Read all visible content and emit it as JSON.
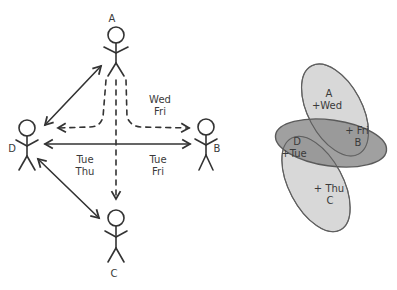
{
  "left_diagram": {
    "people": [
      {
        "id": "A",
        "label": "A"
      },
      {
        "id": "B",
        "label": "B"
      },
      {
        "id": "C",
        "label": "C"
      },
      {
        "id": "D",
        "label": "D"
      }
    ],
    "edge_labels": {
      "a_to_bd_dashed": {
        "line1": "Wed",
        "line2": "Fri"
      },
      "d_left_of_center": {
        "line1": "Tue",
        "line2": "Thu"
      },
      "b_right_of_center": {
        "line1": "Tue",
        "line2": "Fri"
      }
    },
    "connections": [
      {
        "from": "A",
        "to": "D",
        "style": "solid",
        "direction": "both"
      },
      {
        "from": "D",
        "to": "B",
        "style": "solid",
        "direction": "both"
      },
      {
        "from": "D",
        "to": "C",
        "style": "solid",
        "direction": "both"
      },
      {
        "from": "A",
        "to": "D",
        "style": "dashed",
        "direction": "to"
      },
      {
        "from": "A",
        "to": "B",
        "style": "dashed",
        "direction": "to"
      },
      {
        "from": "A",
        "to": "C",
        "style": "dashed",
        "direction": "to"
      }
    ]
  },
  "right_diagram": {
    "ellipses": [
      {
        "name": "A-set",
        "line1": "A",
        "line2": "+Wed"
      },
      {
        "name": "DB-set",
        "line1": "+ Fri",
        "line2": "B",
        "line3": "D",
        "line4": "+Tue"
      },
      {
        "name": "C-set",
        "line1": "+ Thu",
        "line2": "C"
      }
    ],
    "colors": {
      "light_fill": "#d6d6d6",
      "dark_fill": "#8f8f8f",
      "outline": "#6a6a6a"
    }
  }
}
